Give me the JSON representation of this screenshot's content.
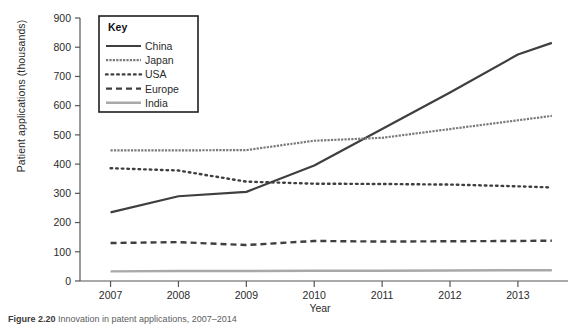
{
  "figure": {
    "caption_label": "Figure 2.20",
    "caption_text": "Innovation in patent applications, 2007–2014"
  },
  "chart_data": {
    "type": "line",
    "title": "",
    "xlabel": "Year",
    "ylabel": "Patient applications (thousands)",
    "x": [
      2007,
      2008,
      2009,
      2010,
      2011,
      2012,
      2013,
      2013.5
    ],
    "xtick_labels": [
      "2007",
      "2008",
      "2009",
      "2010",
      "2011",
      "2012",
      "2013"
    ],
    "xticks": [
      2007,
      2008,
      2009,
      2010,
      2011,
      2012,
      2013
    ],
    "xlim": [
      2006.55,
      2013.62
    ],
    "ytick_labels": [
      "0",
      "100",
      "200",
      "300",
      "400",
      "500",
      "600",
      "700",
      "800",
      "900"
    ],
    "yticks": [
      0,
      100,
      200,
      300,
      400,
      500,
      600,
      700,
      800,
      900
    ],
    "ylim": [
      0,
      900
    ],
    "grid": false,
    "legend_position": "upper-left-inside",
    "legend_title": "Key",
    "series": [
      {
        "name": "China",
        "style": "solid",
        "color": "#3f3f3f",
        "width": 2.2,
        "values": [
          235,
          290,
          305,
          395,
          520,
          645,
          775,
          815
        ]
      },
      {
        "name": "Japan",
        "style": "fine-dotted",
        "color": "#7a7a7a",
        "width": 2.2,
        "values": [
          447,
          447,
          448,
          480,
          490,
          520,
          550,
          565
        ]
      },
      {
        "name": "USA",
        "style": "dotted",
        "color": "#3f3f3f",
        "width": 2.4,
        "values": [
          386,
          378,
          340,
          333,
          332,
          330,
          324,
          320
        ]
      },
      {
        "name": "Europe",
        "style": "dashed",
        "color": "#3f3f3f",
        "width": 2.4,
        "values": [
          130,
          133,
          123,
          137,
          135,
          136,
          137,
          138
        ]
      },
      {
        "name": "India",
        "style": "solid",
        "color": "#a9a9a9",
        "width": 2.4,
        "values": [
          33,
          34,
          34,
          35,
          35,
          36,
          37,
          37
        ]
      }
    ]
  }
}
